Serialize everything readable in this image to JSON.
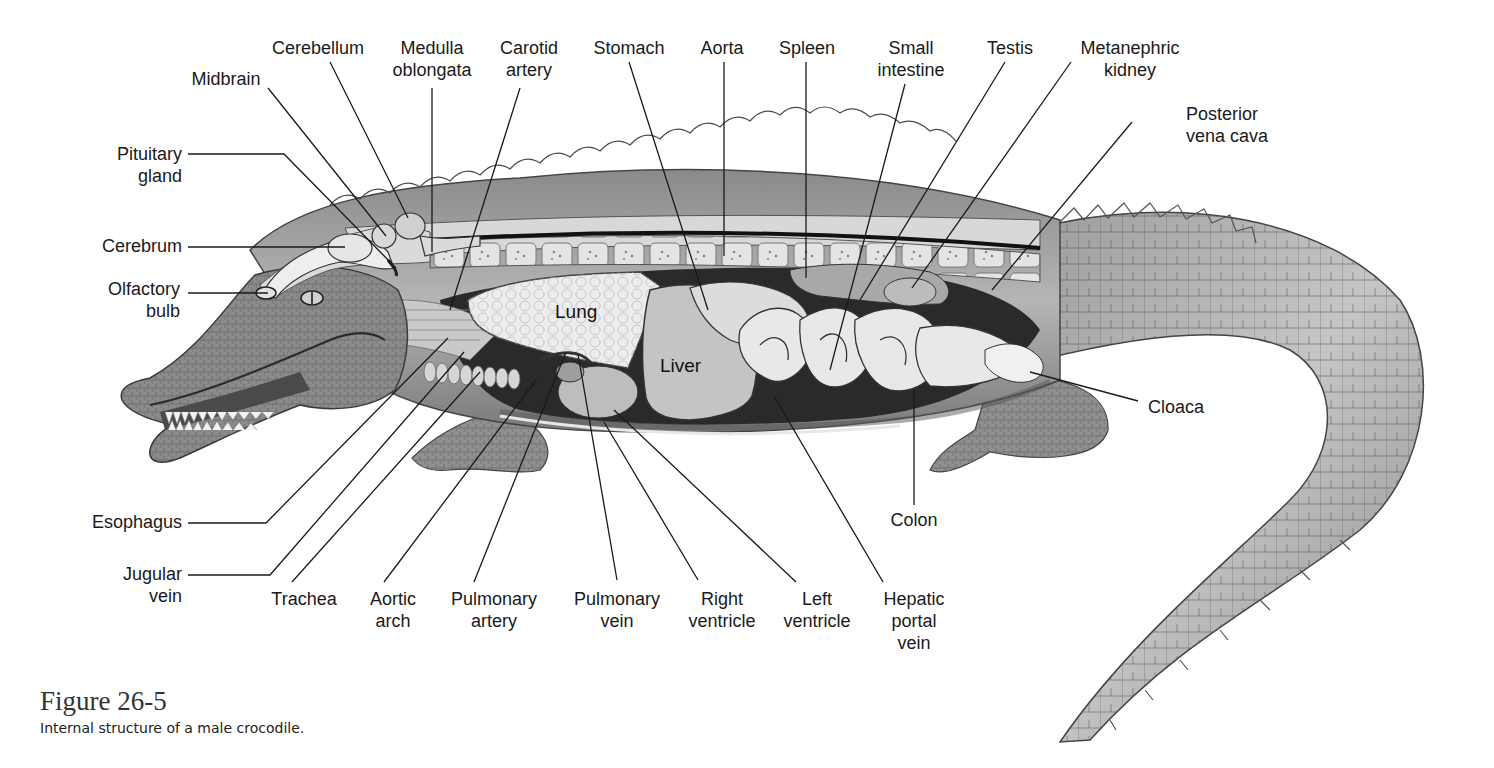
{
  "figure": {
    "number": "Figure 26-5",
    "caption": "Internal structure of a male crocodile."
  },
  "organ_labels": {
    "lung": "Lung",
    "liver": "Liver"
  },
  "labels": [
    {
      "id": "cerebellum",
      "lines": [
        "Cerebellum"
      ],
      "x": 318,
      "y": 54,
      "anchor": "middle",
      "leader": [
        [
          330,
          62
        ],
        [
          408,
          218
        ]
      ]
    },
    {
      "id": "medulla-oblongata",
      "lines": [
        "Medulla",
        "oblongata"
      ],
      "x": 432,
      "y": 54,
      "anchor": "middle",
      "leader": [
        [
          432,
          88
        ],
        [
          432,
          252
        ]
      ]
    },
    {
      "id": "midbrain",
      "lines": [
        "Midbrain"
      ],
      "x": 226,
      "y": 85,
      "anchor": "middle",
      "leader": [
        [
          268,
          88
        ],
        [
          386,
          236
        ]
      ]
    },
    {
      "id": "carotid-artery",
      "lines": [
        "Carotid",
        "artery"
      ],
      "x": 529,
      "y": 54,
      "anchor": "middle",
      "leader": [
        [
          520,
          88
        ],
        [
          450,
          310
        ]
      ]
    },
    {
      "id": "stomach",
      "lines": [
        "Stomach"
      ],
      "x": 629,
      "y": 54,
      "anchor": "middle",
      "leader": [
        [
          629,
          62
        ],
        [
          708,
          310
        ]
      ]
    },
    {
      "id": "aorta",
      "lines": [
        "Aorta"
      ],
      "x": 722,
      "y": 54,
      "anchor": "middle",
      "leader": [
        [
          724,
          62
        ],
        [
          724,
          256
        ]
      ]
    },
    {
      "id": "spleen",
      "lines": [
        "Spleen"
      ],
      "x": 807,
      "y": 54,
      "anchor": "middle",
      "leader": [
        [
          806,
          62
        ],
        [
          806,
          278
        ]
      ]
    },
    {
      "id": "small-intestine",
      "lines": [
        "Small",
        "intestine"
      ],
      "x": 911,
      "y": 54,
      "anchor": "middle",
      "leader": [
        [
          905,
          84
        ],
        [
          830,
          370
        ]
      ]
    },
    {
      "id": "testis",
      "lines": [
        "Testis"
      ],
      "x": 1010,
      "y": 54,
      "anchor": "middle",
      "leader": [
        [
          1005,
          62
        ],
        [
          860,
          300
        ]
      ]
    },
    {
      "id": "metanephric-kidney",
      "lines": [
        "Metanephric",
        "kidney"
      ],
      "x": 1130,
      "y": 54,
      "anchor": "middle",
      "leader": [
        [
          1071,
          62
        ],
        [
          912,
          288
        ]
      ]
    },
    {
      "id": "posterior-vena-cava",
      "lines": [
        "Posterior",
        "vena cava"
      ],
      "x": 1186,
      "y": 120,
      "anchor": "start",
      "leader": [
        [
          1132,
          122
        ],
        [
          992,
          290
        ]
      ]
    },
    {
      "id": "pituitary-gland",
      "lines": [
        "Pituitary",
        "gland"
      ],
      "x": 182,
      "y": 160,
      "anchor": "end",
      "leader": [
        [
          188,
          154
        ],
        [
          284,
          154
        ],
        [
          396,
          268
        ]
      ]
    },
    {
      "id": "cerebrum",
      "lines": [
        "Cerebrum"
      ],
      "x": 182,
      "y": 252,
      "anchor": "end",
      "leader": [
        [
          188,
          247
        ],
        [
          345,
          247
        ]
      ]
    },
    {
      "id": "olfactory-bulb",
      "lines": [
        "Olfactory",
        "bulb"
      ],
      "x": 180,
      "y": 295,
      "anchor": "end",
      "leader": [
        [
          188,
          293
        ],
        [
          268,
          293
        ]
      ]
    },
    {
      "id": "cloaca",
      "lines": [
        "Cloaca"
      ],
      "x": 1148,
      "y": 413,
      "anchor": "start",
      "leader": [
        [
          1138,
          401
        ],
        [
          1030,
          372
        ]
      ]
    },
    {
      "id": "colon",
      "lines": [
        "Colon"
      ],
      "x": 914,
      "y": 526,
      "anchor": "middle",
      "leader": [
        [
          914,
          505
        ],
        [
          914,
          390
        ]
      ]
    },
    {
      "id": "esophagus",
      "lines": [
        "Esophagus"
      ],
      "x": 182,
      "y": 528,
      "anchor": "end",
      "leader": [
        [
          188,
          523
        ],
        [
          266,
          523
        ],
        [
          448,
          338
        ]
      ]
    },
    {
      "id": "jugular-vein",
      "lines": [
        "Jugular",
        "vein"
      ],
      "x": 182,
      "y": 580,
      "anchor": "end",
      "leader": [
        [
          188,
          575
        ],
        [
          270,
          575
        ],
        [
          464,
          352
        ]
      ]
    },
    {
      "id": "trachea",
      "lines": [
        "Trachea"
      ],
      "x": 304,
      "y": 605,
      "anchor": "middle",
      "leader": [
        [
          292,
          582
        ],
        [
          480,
          372
        ]
      ]
    },
    {
      "id": "aortic-arch",
      "lines": [
        "Aortic",
        "arch"
      ],
      "x": 393,
      "y": 605,
      "anchor": "middle",
      "leader": [
        [
          384,
          582
        ],
        [
          536,
          380
        ]
      ]
    },
    {
      "id": "pulmonary-artery",
      "lines": [
        "Pulmonary",
        "artery"
      ],
      "x": 494,
      "y": 605,
      "anchor": "middle",
      "leader": [
        [
          474,
          582
        ],
        [
          566,
          352
        ]
      ]
    },
    {
      "id": "pulmonary-vein",
      "lines": [
        "Pulmonary",
        "vein"
      ],
      "x": 617,
      "y": 605,
      "anchor": "middle",
      "leader": [
        [
          617,
          580
        ],
        [
          578,
          354
        ]
      ]
    },
    {
      "id": "right-ventricle",
      "lines": [
        "Right",
        "ventricle"
      ],
      "x": 722,
      "y": 605,
      "anchor": "middle",
      "leader": [
        [
          698,
          580
        ],
        [
          604,
          422
        ]
      ]
    },
    {
      "id": "left-ventricle",
      "lines": [
        "Left",
        "ventricle"
      ],
      "x": 817,
      "y": 605,
      "anchor": "middle",
      "leader": [
        [
          796,
          582
        ],
        [
          614,
          410
        ]
      ]
    },
    {
      "id": "hepatic-portal-vein",
      "lines": [
        "Hepatic",
        "portal",
        "vein"
      ],
      "x": 914,
      "y": 605,
      "anchor": "middle",
      "leader": [
        [
          883,
          582
        ],
        [
          774,
          396
        ]
      ]
    }
  ],
  "colors": {
    "text": "#1a1a1a",
    "leader": "#1a1a1a",
    "skin_dark": "#6f6f6f",
    "skin_mid": "#9a9a9a",
    "skin_light": "#cfcfcf",
    "organ_light": "#e8e8e8",
    "cavity_dark": "#222222"
  }
}
